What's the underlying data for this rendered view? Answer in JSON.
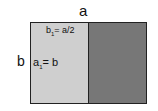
{
  "labels": {
    "top": "a",
    "side": "b",
    "inner_top_var": "b",
    "inner_top_sub": "1",
    "inner_top_rest": "= a/2",
    "inner_mid_var": "a",
    "inner_mid_sub": "1",
    "inner_mid_rest": "= b"
  },
  "colors": {
    "left_fill": "#cfcfcf",
    "right_fill": "#777777"
  }
}
